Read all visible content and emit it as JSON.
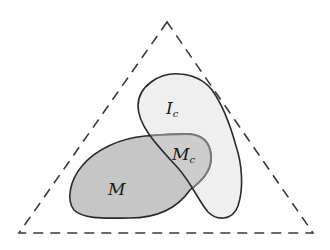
{
  "diagram": {
    "type": "set-diagram",
    "outer_region": {
      "shape": "triangle",
      "style": "dashed",
      "stroke_color": "#3a3a3a"
    },
    "regions": [
      {
        "id": "M",
        "label": "M",
        "subscript": "",
        "fill": "#c6c6c6",
        "stroke": "#2a2a2a"
      },
      {
        "id": "Ic",
        "label": "I",
        "subscript": "c",
        "fill": "#efefef",
        "stroke": "#2a2a2a"
      },
      {
        "id": "Mc",
        "label": "M",
        "subscript": "c",
        "fill": "#cdcdcd",
        "stroke": "#7a7a7a",
        "note": "intersection of M and Ic"
      }
    ]
  }
}
